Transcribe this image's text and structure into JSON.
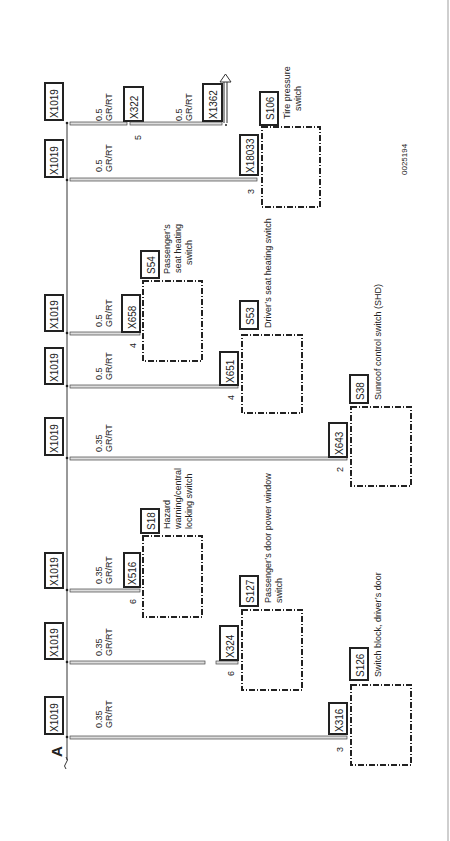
{
  "diagram": {
    "reference_label": "A",
    "figure_id": "0025194",
    "bus_connector": "X1019",
    "circuits": [
      {
        "id": "row1",
        "bus_connector": "X1019",
        "wire_size": "0.5",
        "wire_color": "GR/RT",
        "connector": "X322",
        "pin": "5",
        "continuation": {
          "wire_size": "0.5",
          "wire_color": "GR/RT",
          "connector": "X1362",
          "arrow": "arrow-up-icon"
        }
      },
      {
        "id": "row2",
        "bus_connector": "X1019",
        "wire_size": "0.5",
        "wire_color": "GR/RT",
        "connector": "X18033",
        "pin": "3",
        "component": "S106",
        "component_label": [
          "Tire pressure",
          "switch"
        ]
      },
      {
        "id": "row3",
        "bus_connector": "X1019",
        "wire_size": "0.5",
        "wire_color": "GR/RT",
        "connector": "X658",
        "pin": "4",
        "component": "S54",
        "component_label": [
          "Passenger’s",
          "seat heating",
          "switch"
        ]
      },
      {
        "id": "row4",
        "bus_connector": "X1019",
        "wire_size": "0.5",
        "wire_color": "GR/RT",
        "connector": "X651",
        "pin": "4",
        "component": "S53",
        "component_label": [
          "Driver’s seat heating switch"
        ]
      },
      {
        "id": "row5",
        "bus_connector": "X1019",
        "wire_size": "0.35",
        "wire_color": "GR/RT",
        "connector": "X643",
        "pin": "2",
        "component": "S38",
        "component_label": [
          "Sunroof control switch (SHD)"
        ]
      },
      {
        "id": "row6",
        "bus_connector": "X1019",
        "wire_size": "0.35",
        "wire_color": "GR/RT",
        "connector": "X516",
        "pin": "6",
        "component": "S18",
        "component_label": [
          "Hazard",
          "warning/central",
          "locking switch"
        ]
      },
      {
        "id": "row7",
        "bus_connector": "X1019",
        "wire_size": "0.35",
        "wire_color": "GR/RT",
        "connector": "X324",
        "pin": "6",
        "component": "S127",
        "component_label": [
          "Passenger’s door power window",
          "switch"
        ]
      },
      {
        "id": "row8",
        "bus_connector": "X1019",
        "wire_size": "0.35",
        "wire_color": "GR/RT",
        "connector": "X316",
        "pin": "3",
        "component": "S126",
        "component_label": [
          "Switch block, driver’s door"
        ]
      }
    ]
  }
}
